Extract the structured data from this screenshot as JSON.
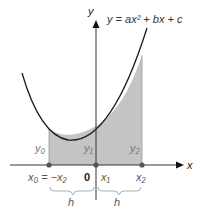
{
  "diagram": {
    "equation": "y = ax² + bx + c",
    "axes": {
      "x_label": "x",
      "y_label": "y",
      "origin_label": "0"
    },
    "points": [
      {
        "x_label": "x₀ = −x₂",
        "y_label": "y₀"
      },
      {
        "x_label": "x₁",
        "y_label": "y₁"
      },
      {
        "x_label": "x₂",
        "y_label": "y₂"
      }
    ],
    "intervals": [
      {
        "label": "h"
      },
      {
        "label": "h"
      }
    ],
    "colors": {
      "shade": "#c4c4c4",
      "curve": "#1a1a1a",
      "axis": "#333333",
      "point": "#555555"
    }
  }
}
